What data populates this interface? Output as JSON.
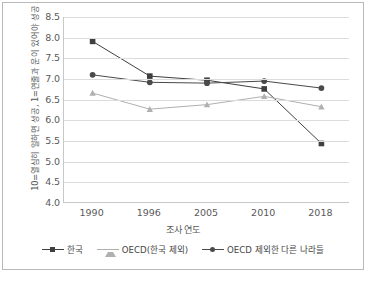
{
  "chart_data": {
    "type": "line",
    "title": "",
    "xlabel": "조사 연도",
    "ylabel": "10=열심히 일하면 성공, 1=연줄과 운이 있어야 성공",
    "categories": [
      "1990",
      "1996",
      "2005",
      "2010",
      "2018"
    ],
    "ylim": [
      4.0,
      8.5
    ],
    "yticks": [
      "8.5",
      "8.0",
      "7.5",
      "7.0",
      "6.5",
      "6.0",
      "5.5",
      "5.0",
      "4.5",
      "4.0"
    ],
    "ytick_values": [
      8.5,
      8.0,
      7.5,
      7.0,
      6.5,
      6.0,
      5.5,
      5.0,
      4.5,
      4.0
    ],
    "grid": true,
    "legend_position": "bottom",
    "series": [
      {
        "name": "한국",
        "marker": "square",
        "color": "#3f3f3f",
        "values": [
          7.91,
          7.07,
          6.97,
          6.76,
          5.44
        ]
      },
      {
        "name": "OECD(한국 제외)",
        "marker": "triangle",
        "color": "#b0b0b0",
        "values": [
          6.66,
          6.27,
          6.38,
          6.58,
          6.33
        ]
      },
      {
        "name": "OECD 제외한 다른 나라들",
        "marker": "circle",
        "color": "#4a4a4a",
        "values": [
          7.1,
          6.92,
          6.9,
          6.95,
          6.78
        ]
      }
    ]
  },
  "colors": {
    "grid": "#dcdcdc",
    "axis": "#c8c8c8",
    "text": "#595959",
    "frame": "#b9b9b9"
  }
}
